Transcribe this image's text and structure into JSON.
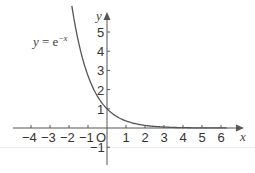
{
  "chart_data": {
    "type": "line",
    "title": "",
    "xlabel": "x",
    "ylabel": "y",
    "origin_label": "O",
    "xlim": [
      -4.5,
      7
    ],
    "ylim": [
      -2,
      6
    ],
    "x_ticks": [
      -4,
      -3,
      -2,
      -1,
      1,
      2,
      3,
      4,
      5,
      6
    ],
    "x_tick_labels": [
      "−4",
      "−3",
      "−2",
      "−1",
      "1",
      "2",
      "3",
      "4",
      "5",
      "6"
    ],
    "y_ticks": [
      5,
      4,
      3,
      2,
      1,
      -1
    ],
    "y_tick_labels": [
      "5",
      "4",
      "3",
      "2",
      "1",
      "−1"
    ],
    "grid": false,
    "series": [
      {
        "name": "y = e^-x",
        "function": "exp(-x)",
        "x": [
          -1.85,
          -1.5,
          -1,
          -0.5,
          0,
          0.5,
          1,
          1.5,
          2,
          3,
          4,
          5,
          6
        ],
        "values": [
          6.36,
          4.48,
          2.72,
          1.65,
          1,
          0.61,
          0.37,
          0.22,
          0.14,
          0.05,
          0.02,
          0.01,
          0.0
        ]
      }
    ],
    "annotations": [
      {
        "text": "y = e⁻ˣ",
        "position": "upper-left of curve"
      }
    ],
    "colors": {
      "axis": "#555555",
      "curve": "#555555",
      "text": "#333333"
    }
  }
}
